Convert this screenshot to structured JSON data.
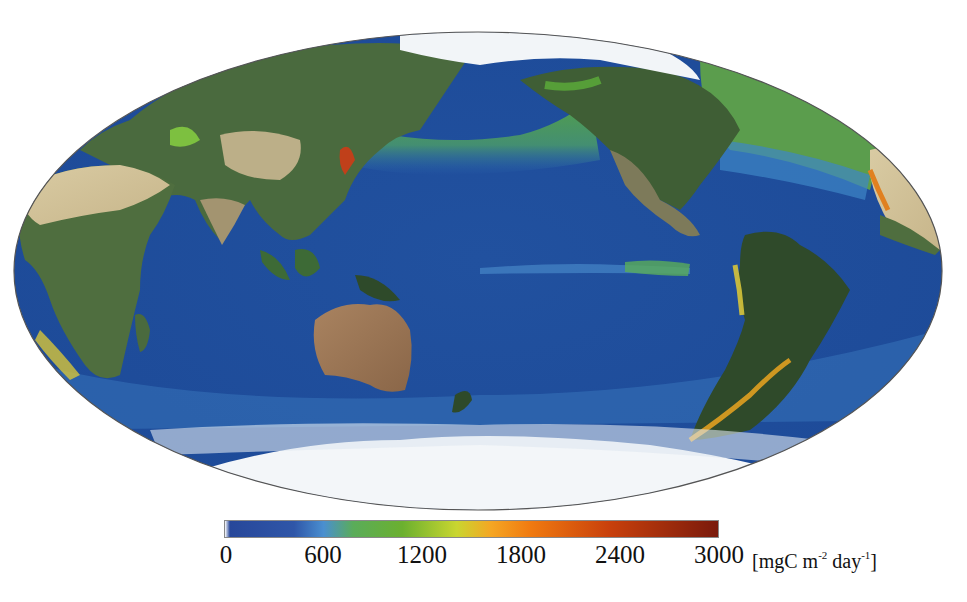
{
  "figure": {
    "projection": "Mollweide (Pacific-centered)",
    "variable": "Net primary production",
    "ocean_color_base": "#1f4fa0"
  },
  "colorbar": {
    "min": 0,
    "max": 3000,
    "ticks": [
      "0",
      "600",
      "1200",
      "1800",
      "2400",
      "3000"
    ],
    "tick_values": [
      0,
      600,
      1200,
      1800,
      2400,
      3000
    ],
    "unit_prefix": "[mgC m",
    "unit_exp1": "-2",
    "unit_mid": " day",
    "unit_exp2": "-1",
    "unit_suffix": "]",
    "stops": [
      {
        "pos": 0.0,
        "color": "#ffffff"
      },
      {
        "pos": 0.01,
        "color": "#27479a"
      },
      {
        "pos": 0.14,
        "color": "#2f56a8"
      },
      {
        "pos": 0.2,
        "color": "#4a8fd0"
      },
      {
        "pos": 0.26,
        "color": "#5aac5a"
      },
      {
        "pos": 0.36,
        "color": "#6bb02f"
      },
      {
        "pos": 0.47,
        "color": "#c9d630"
      },
      {
        "pos": 0.54,
        "color": "#f5a623"
      },
      {
        "pos": 0.62,
        "color": "#f07a10"
      },
      {
        "pos": 0.78,
        "color": "#c8400c"
      },
      {
        "pos": 1.0,
        "color": "#7a1a0c"
      }
    ]
  },
  "map": {
    "ellipse": {
      "cx": 478,
      "cy": 271,
      "rx": 464,
      "ry": 239
    },
    "regions": [
      "Asia",
      "Europe",
      "Africa",
      "Australia",
      "North America",
      "South America",
      "Antarctica",
      "Arctic",
      "Pacific Ocean",
      "Atlantic Ocean",
      "Indian Ocean"
    ]
  }
}
